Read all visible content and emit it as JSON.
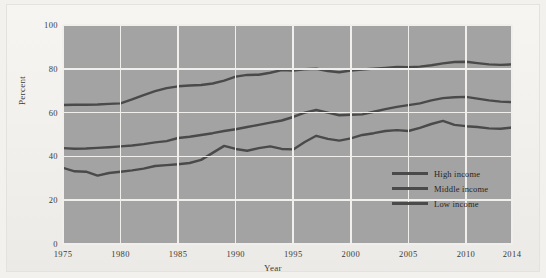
{
  "chart_data": {
    "type": "line",
    "title": "",
    "xlabel": "Year",
    "ylabel": "Percent",
    "xlim": [
      1975,
      2014
    ],
    "ylim": [
      0,
      100
    ],
    "grid": true,
    "legend_position": "bottom-right",
    "y_ticks": [
      100,
      80,
      60,
      40,
      20,
      0
    ],
    "x_ticks": [
      1975,
      1980,
      1985,
      1990,
      1995,
      2000,
      2005,
      2010,
      2014
    ],
    "x": [
      1975,
      1976,
      1977,
      1978,
      1979,
      1980,
      1981,
      1982,
      1983,
      1984,
      1985,
      1986,
      1987,
      1988,
      1989,
      1990,
      1991,
      1992,
      1993,
      1994,
      1995,
      1996,
      1997,
      1998,
      1999,
      2000,
      2001,
      2002,
      2003,
      2004,
      2005,
      2006,
      2007,
      2008,
      2009,
      2010,
      2011,
      2012,
      2013,
      2014
    ],
    "series": [
      {
        "name": "High income",
        "color": "#4a4a4a",
        "values": [
          63.5,
          63.6,
          63.6,
          63.7,
          64.0,
          64.2,
          66.0,
          68.0,
          69.8,
          71.2,
          72.0,
          72.4,
          72.6,
          73.3,
          74.6,
          76.4,
          77.2,
          77.3,
          78.2,
          79.4,
          79.2,
          79.8,
          80.0,
          79.0,
          78.4,
          79.2,
          79.7,
          80.1,
          80.4,
          80.8,
          80.7,
          81.0,
          81.6,
          82.5,
          83.1,
          83.2,
          82.6,
          82.0,
          81.8,
          82.0
        ]
      },
      {
        "name": "Middle income",
        "color": "#4a4a4a",
        "values": [
          43.8,
          43.5,
          43.6,
          43.9,
          44.2,
          44.6,
          45.0,
          45.6,
          46.4,
          47.0,
          48.4,
          49.0,
          49.8,
          50.6,
          51.6,
          52.4,
          53.4,
          54.4,
          55.4,
          56.4,
          58.0,
          60.0,
          61.2,
          60.0,
          58.8,
          59.0,
          59.2,
          60.4,
          61.6,
          62.6,
          63.4,
          64.2,
          65.6,
          66.6,
          67.0,
          67.2,
          66.4,
          65.6,
          65.0,
          64.8
        ]
      },
      {
        "name": "Low income",
        "color": "#4a4a4a",
        "values": [
          34.8,
          33.2,
          33.0,
          31.2,
          32.4,
          33.0,
          33.6,
          34.4,
          35.6,
          36.0,
          36.4,
          37.0,
          38.4,
          41.6,
          44.8,
          43.4,
          42.6,
          43.8,
          44.6,
          43.4,
          43.2,
          46.6,
          49.4,
          48.0,
          47.2,
          48.2,
          49.8,
          50.6,
          51.6,
          52.0,
          51.6,
          53.0,
          54.8,
          56.2,
          54.4,
          53.8,
          53.4,
          52.8,
          52.6,
          53.2
        ]
      }
    ]
  },
  "legend": {
    "items": [
      {
        "label": "High income"
      },
      {
        "label": "Middle income"
      },
      {
        "label": "Low income"
      }
    ]
  },
  "axes": {
    "y_label": "Percent",
    "x_label": "Year",
    "y_tick_labels": [
      "100",
      "80",
      "60",
      "40",
      "20",
      "0"
    ],
    "x_tick_labels": [
      "1975",
      "1980",
      "1985",
      "1990",
      "1995",
      "2000",
      "2005",
      "2010",
      "2014"
    ]
  },
  "colors": {
    "plot_background": "#a3a3a3",
    "gridline": "#f0efec",
    "line": "#4a4a4a",
    "page_background": "#f2f1ee",
    "text": "#3a3a3a"
  }
}
